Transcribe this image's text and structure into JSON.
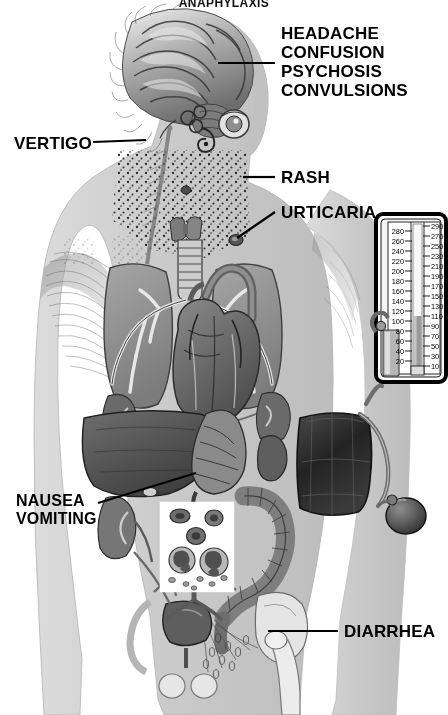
{
  "figure": {
    "title": "ANAPHYLAXIS",
    "kind": "medical-illustration",
    "palette": {
      "background": "#ffffff",
      "body_silhouette": "#c9c9c9",
      "body_silhouette_light": "#d8d8d8",
      "organ_mid": "#8d8d8d",
      "organ_dark": "#5a5a5a",
      "organ_darkest": "#3a3a3a",
      "line": "#000000",
      "label_text": "#000000",
      "inset_panel": "#ffffff",
      "cuff_dark": "#2b2b2b"
    }
  },
  "labels": [
    {
      "id": "cerebral",
      "text": "HEADACHE\nCONFUSION\nPSYCHOSIS\nCONVULSIONS",
      "lines": [
        "HEADACHE",
        "CONFUSION",
        "PSYCHOSIS",
        "CONVULSIONS"
      ],
      "x": 281,
      "y": 24,
      "font_size": 17,
      "align": "left",
      "points_to": "brain"
    },
    {
      "id": "vertigo",
      "text": "VERTIGO",
      "lines": [
        "VERTIGO"
      ],
      "x": 14,
      "y": 134,
      "font_size": 17,
      "align": "left",
      "points_to": "inner-ear"
    },
    {
      "id": "rash",
      "text": "RASH",
      "lines": [
        "RASH"
      ],
      "x": 281,
      "y": 168,
      "font_size": 17,
      "align": "left",
      "points_to": "neck-skin-stippling"
    },
    {
      "id": "urticaria",
      "text": "URTICARIA",
      "lines": [
        "URTICARIA"
      ],
      "x": 281,
      "y": 203,
      "font_size": 17,
      "align": "left",
      "points_to": "hive-lesion"
    },
    {
      "id": "nausea-vomiting",
      "text": "NAUSEA\nVOMITING",
      "lines": [
        "NAUSEA",
        "VOMITING"
      ],
      "x": 16,
      "y": 492,
      "font_size": 16,
      "align": "left",
      "points_to": "stomach"
    },
    {
      "id": "diarrhea",
      "text": "DIARRHEA",
      "lines": [
        "DIARRHEA"
      ],
      "x": 344,
      "y": 622,
      "font_size": 17,
      "align": "left",
      "points_to": "colon-rectum"
    }
  ],
  "leaders": [
    {
      "id": "leader-cerebral",
      "x1": 275,
      "y1": 63,
      "x2": 218,
      "y2": 63
    },
    {
      "id": "leader-vertigo",
      "x1": 93,
      "y1": 142,
      "x2": 146,
      "y2": 140
    },
    {
      "id": "leader-rash",
      "x1": 275,
      "y1": 177,
      "x2": 243,
      "y2": 177
    },
    {
      "id": "leader-urticaria",
      "x1": 275,
      "y1": 212,
      "x2": 237,
      "y2": 238
    },
    {
      "id": "leader-nausea",
      "x1": 98,
      "y1": 503,
      "x2": 196,
      "y2": 473
    },
    {
      "id": "leader-diarrhea",
      "x1": 338,
      "y1": 631,
      "x2": 268,
      "y2": 631
    }
  ],
  "sphygmomanometer": {
    "name": "mercury-sphygmomanometer",
    "frame": {
      "x": 376,
      "y": 214,
      "w": 70,
      "h": 168
    },
    "left_scale_values": [
      280,
      260,
      240,
      220,
      200,
      180,
      160,
      140,
      120,
      100,
      80,
      60,
      40,
      20
    ],
    "right_scale_values": [
      290,
      270,
      250,
      230,
      210,
      190,
      170,
      150,
      130,
      110,
      90,
      70,
      50,
      30,
      10
    ],
    "scale_min": 0,
    "scale_max": 300,
    "units": "mmHg",
    "mercury_level": 110,
    "reservoir_label": "mercury-reservoir"
  },
  "cuff": {
    "name": "blood-pressure-cuff",
    "bulb_label": "inflation-bulb",
    "tubing_label": "cuff-tubing"
  },
  "blood_inset": {
    "name": "blood-smear-inset",
    "panel": {
      "x": 160,
      "y": 502,
      "w": 74,
      "h": 90
    },
    "cells": [
      {
        "type": "erythrocyte",
        "count": 3
      },
      {
        "type": "neutrophil",
        "count": 2
      },
      {
        "type": "platelet",
        "count": 6
      }
    ]
  },
  "anatomy": [
    {
      "id": "brain",
      "label": "brain"
    },
    {
      "id": "inner-ear",
      "label": "inner-ear-cochlea"
    },
    {
      "id": "eye",
      "label": "eye"
    },
    {
      "id": "thyroid",
      "label": "thyroid-gland"
    },
    {
      "id": "trachea",
      "label": "trachea"
    },
    {
      "id": "lung-left",
      "label": "left-lung"
    },
    {
      "id": "lung-right",
      "label": "right-lung"
    },
    {
      "id": "bronchi",
      "label": "bronchial-tree"
    },
    {
      "id": "heart",
      "label": "heart"
    },
    {
      "id": "aorta",
      "label": "aortic-arch"
    },
    {
      "id": "liver",
      "label": "liver"
    },
    {
      "id": "stomach",
      "label": "stomach"
    },
    {
      "id": "spleen",
      "label": "spleen"
    },
    {
      "id": "kidney-left",
      "label": "left-kidney"
    },
    {
      "id": "kidney-right",
      "label": "right-kidney"
    },
    {
      "id": "colon",
      "label": "colon"
    },
    {
      "id": "bladder",
      "label": "urinary-bladder"
    },
    {
      "id": "pelvis",
      "label": "pelvis-bone"
    },
    {
      "id": "femur",
      "label": "femur"
    },
    {
      "id": "deltoid",
      "label": "shoulder-musculature"
    },
    {
      "id": "rash-stipple",
      "label": "skin-rash-stippling"
    }
  ]
}
